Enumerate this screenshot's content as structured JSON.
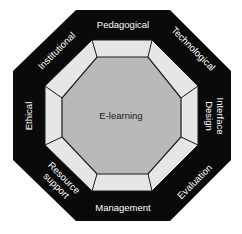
{
  "diagram": {
    "title": "E-learning",
    "center_label": "E-learning",
    "colors": {
      "outer_band": "#0a0a0a",
      "middle_ring": "#e6e6e6",
      "inner_core": "#b9b9b9",
      "outline": "#1a1a1a",
      "label_text": "#ffffff",
      "center_text": "#1a1a1a"
    },
    "dimensions": [
      {
        "position": "top",
        "label": "Pedagogical"
      },
      {
        "position": "top-right",
        "label": "Technological"
      },
      {
        "position": "right",
        "label_line1": "Interface",
        "label_line2": "Design"
      },
      {
        "position": "bottom-right",
        "label": "Evaluation"
      },
      {
        "position": "bottom",
        "label": "Management"
      },
      {
        "position": "bottom-left",
        "label_line1": "Resource",
        "label_line2": "support"
      },
      {
        "position": "left",
        "label": "Ethical"
      },
      {
        "position": "top-left",
        "label": "Institutional"
      }
    ]
  }
}
